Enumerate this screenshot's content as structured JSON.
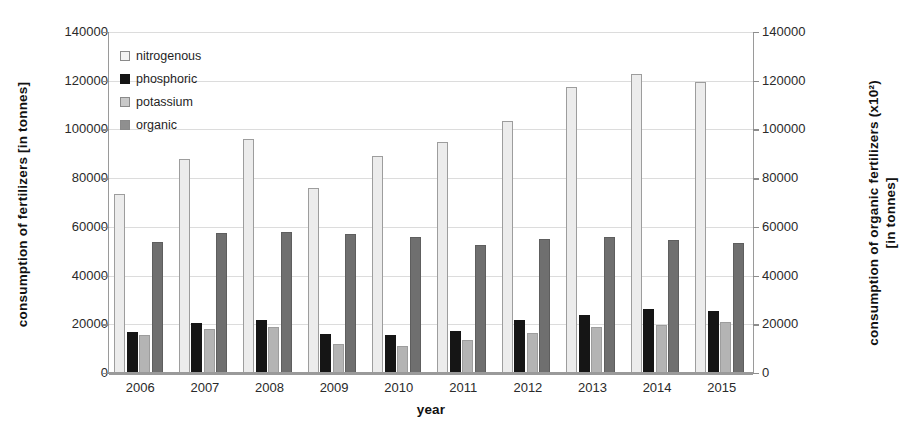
{
  "chart_data": {
    "type": "bar",
    "title": "",
    "xlabel": "year",
    "ylabel": "consumption of  fertilizers  [in tonnes]",
    "ylabel_right": "consumption of  organic  fertilizers  (x10²)\n[in tonnes]",
    "ylim": [
      0,
      140000
    ],
    "ylim_right": [
      0,
      140000
    ],
    "ytick_labels": [
      "0",
      "20000",
      "40000",
      "60000",
      "80000",
      "100000",
      "120000",
      "140000"
    ],
    "ytick_values": [
      0,
      20000,
      40000,
      60000,
      80000,
      100000,
      120000,
      140000
    ],
    "ytick_labels_right": [
      "0",
      "20000",
      "40000",
      "60000",
      "80000",
      "100000",
      "120000",
      "140000"
    ],
    "grid": true,
    "legend_position": "upper left (inside axes)",
    "categories": [
      "2006",
      "2007",
      "2008",
      "2009",
      "2010",
      "2011",
      "2012",
      "2013",
      "2014",
      "2015"
    ],
    "series": [
      {
        "name": "nitrogenous",
        "color": "#ececec",
        "axis": "left",
        "values": [
          73000,
          87500,
          95500,
          75500,
          88500,
          94500,
          103000,
          117000,
          122500,
          119000
        ]
      },
      {
        "name": "phosphoric",
        "color": "#151515",
        "axis": "left",
        "values": [
          16500,
          20000,
          21500,
          15500,
          15000,
          17000,
          21500,
          23500,
          26000,
          25000
        ]
      },
      {
        "name": "potassium",
        "color": "#b4b4b4",
        "axis": "left",
        "values": [
          15000,
          17500,
          18500,
          11500,
          10500,
          13000,
          16000,
          18500,
          19500,
          20500
        ]
      },
      {
        "name": "organic",
        "color": "#6f6f6f",
        "axis": "right",
        "values": [
          53500,
          57000,
          57500,
          56500,
          55500,
          52000,
          54500,
          55500,
          54000,
          53000
        ]
      }
    ]
  },
  "legend": {
    "items": [
      {
        "label": "nitrogenous"
      },
      {
        "label": "phosphoric"
      },
      {
        "label": "potassium"
      },
      {
        "label": "organic"
      }
    ]
  }
}
